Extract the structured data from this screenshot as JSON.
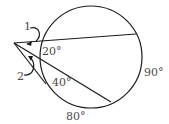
{
  "diagram": {
    "type": "circle-secant-angles",
    "labels": {
      "angle_1": "1",
      "angle_2": "2",
      "arc_small_upper": "20°",
      "arc_small_lower": "40°",
      "arc_right": "90°",
      "arc_bottom": "80°"
    },
    "colors": {
      "line": "#1a1a1a",
      "text": "#4a4a4a",
      "background": "#ffffff"
    }
  }
}
